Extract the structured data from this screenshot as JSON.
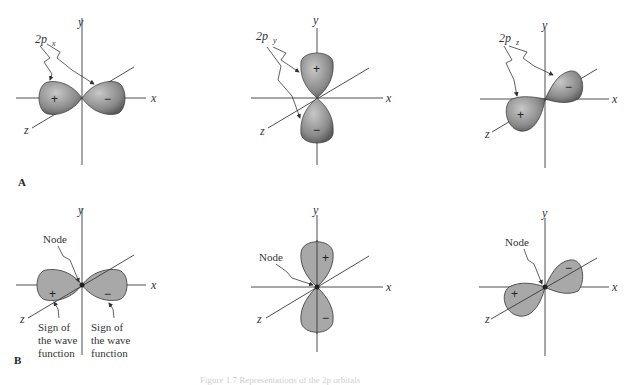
{
  "figure": {
    "panel_a_label": "A",
    "panel_b_label": "B",
    "caption_partial": "Figure 1.7 Representations of the 2p orbitals",
    "colors": {
      "lobe_fill_flat": "#a8a8a8",
      "lobe_shaded_dark": "#6a6a6a",
      "lobe_shaded_light": "#c8c8c8",
      "axis": "#3a3a3a"
    },
    "axes": {
      "x": "x",
      "y": "y",
      "z": "z"
    },
    "row_a": [
      {
        "orbital_main": "2p",
        "orbital_sub": "x",
        "positive_sign": "+",
        "negative_sign": "−"
      },
      {
        "orbital_main": "2p",
        "orbital_sub": "y",
        "positive_sign": "+",
        "negative_sign": "−"
      },
      {
        "orbital_main": "2p",
        "orbital_sub": "z",
        "positive_sign": "+",
        "negative_sign": "−"
      }
    ],
    "row_b": [
      {
        "node_label": "Node",
        "positive_sign": "+",
        "negative_sign": "−",
        "sign_note_left": [
          "Sign of",
          "the wave",
          "function"
        ],
        "sign_note_right": [
          "Sign of",
          "the wave",
          "function"
        ]
      },
      {
        "node_label": "Node",
        "positive_sign": "+",
        "negative_sign": "−"
      },
      {
        "node_label": "Node",
        "positive_sign": "+",
        "negative_sign": "−"
      }
    ]
  }
}
